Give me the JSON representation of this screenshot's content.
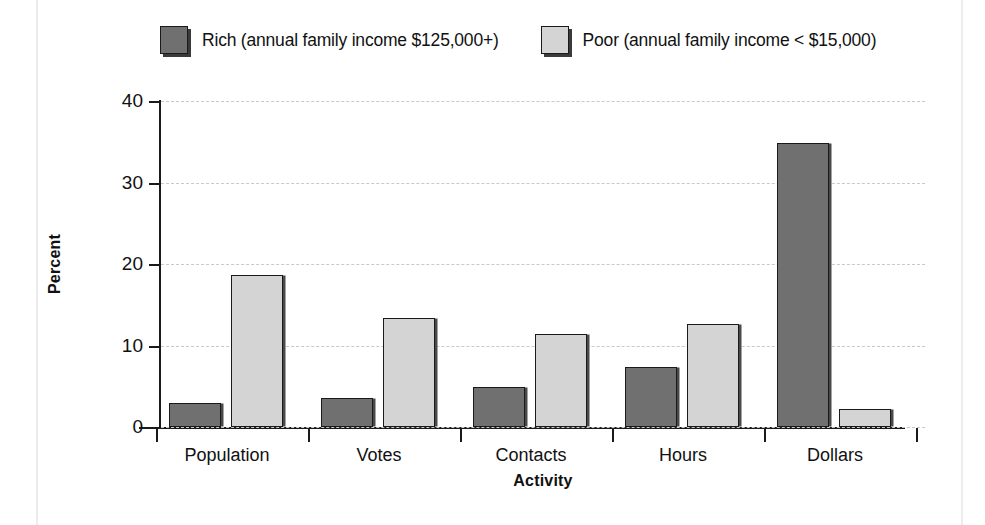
{
  "chart_data": {
    "type": "bar",
    "title": "",
    "xlabel": "Activity",
    "ylabel": "Percent",
    "categories": [
      "Population",
      "Votes",
      "Contacts",
      "Hours",
      "Dollars"
    ],
    "series": [
      {
        "name": "Rich (annual family income $125,000+)",
        "color": "#707070",
        "values": [
          3.0,
          3.6,
          4.9,
          7.4,
          34.8
        ]
      },
      {
        "name": "Poor (annual family income < $15,000)",
        "color": "#d4d4d4",
        "values": [
          18.6,
          13.4,
          11.4,
          12.7,
          2.2
        ]
      }
    ],
    "ylim": [
      0,
      40
    ],
    "yticks": [
      0,
      10,
      20,
      30,
      40
    ],
    "ytick_labels": [
      "0",
      "10",
      "20",
      "30",
      "40"
    ],
    "grid": true,
    "grid_axis": "y",
    "grid_style": "dashed",
    "legend_position": "top"
  },
  "legend": {
    "items": [
      {
        "label": "Rich (annual family income $125,000+)",
        "swatch": "dark-gray-swatch"
      },
      {
        "label": "Poor (annual family income < $15,000)",
        "swatch": "light-gray-swatch"
      }
    ]
  },
  "axes": {
    "y_title": "Percent",
    "x_title": "Activity"
  }
}
